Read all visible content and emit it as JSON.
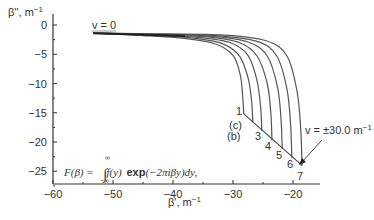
{
  "chart_data": {
    "type": "line",
    "title": "",
    "xlabel": "β', m⁻¹",
    "ylabel": "β'', m⁻¹",
    "xlim": [
      -60,
      -15
    ],
    "ylim": [
      -27,
      2
    ],
    "xticks": [
      -60,
      -50,
      -40,
      -30,
      -20
    ],
    "yticks": [
      0,
      -5,
      -10,
      -15,
      -20,
      -25
    ],
    "xtick_labels": [
      "−60",
      "−50",
      "−40",
      "−30",
      "−20"
    ],
    "ytick_labels": [
      "0",
      "−5",
      "−10",
      "−15",
      "−20",
      "−25"
    ],
    "grid": false,
    "series": [
      {
        "name": "1",
        "x": [
          -53.3,
          -45,
          -38,
          -33,
          -30,
          -28.8,
          -28.4,
          -28.2
        ],
        "y": [
          -1.4,
          -1.8,
          -2.3,
          -3.2,
          -5.2,
          -8.5,
          -12.0,
          -15.2
        ]
      },
      {
        "name": "2",
        "x": [
          -53.3,
          -45,
          -37,
          -32,
          -29,
          -27.5,
          -26.9,
          -26.7
        ],
        "y": [
          -1.4,
          -1.7,
          -2.2,
          -3.1,
          -5.2,
          -9.0,
          -13.0,
          -16.6
        ]
      },
      {
        "name": "3",
        "x": [
          -53.3,
          -45,
          -36,
          -30.5,
          -27.5,
          -26.0,
          -25.4,
          -25.2
        ],
        "y": [
          -1.4,
          -1.7,
          -2.1,
          -3.0,
          -5.2,
          -9.5,
          -14.0,
          -18.1
        ]
      },
      {
        "name": "4",
        "x": [
          -53.3,
          -45,
          -35,
          -29,
          -26,
          -24.3,
          -23.7,
          -23.5
        ],
        "y": [
          -1.4,
          -1.6,
          -2.0,
          -3.0,
          -5.3,
          -10.0,
          -15.0,
          -19.7
        ]
      },
      {
        "name": "5",
        "x": [
          -53.3,
          -45,
          -34,
          -27.5,
          -24.3,
          -22.6,
          -22.0,
          -21.8
        ],
        "y": [
          -1.4,
          -1.6,
          -1.9,
          -2.9,
          -5.3,
          -10.5,
          -16.0,
          -21.2
        ]
      },
      {
        "name": "6",
        "x": [
          -53.3,
          -45,
          -33,
          -26,
          -22.7,
          -21.0,
          -20.4,
          -20.2
        ],
        "y": [
          -1.4,
          -1.5,
          -1.8,
          -2.8,
          -5.3,
          -11.0,
          -17.0,
          -22.7
        ]
      },
      {
        "name": "7",
        "x": [
          -53.3,
          -45,
          -32,
          -24.5,
          -21.0,
          -19.3,
          -18.7,
          -18.5
        ],
        "y": [
          -1.4,
          -1.5,
          -1.7,
          -2.7,
          -5.3,
          -11.5,
          -18.0,
          -24.0
        ]
      }
    ],
    "envelope_line": {
      "x": [
        -28.2,
        -18.5
      ],
      "y": [
        -15.2,
        -24.0
      ]
    },
    "annotations": [
      {
        "text": "v = 0",
        "x": -51.5,
        "y": -0.8
      },
      {
        "text": "1",
        "x": -29.0,
        "y": -14.8
      },
      {
        "text": "(c)",
        "x": -29.5,
        "y": -17.2
      },
      {
        "text": "(b)",
        "x": -29.8,
        "y": -19.0
      },
      {
        "text": "3",
        "x": -26.0,
        "y": -19.0
      },
      {
        "text": "4",
        "x": -24.5,
        "y": -20.8
      },
      {
        "text": "5",
        "x": -22.8,
        "y": -22.4
      },
      {
        "text": "6",
        "x": -21.0,
        "y": -24.0
      },
      {
        "text": "7",
        "x": -19.2,
        "y": -25.8
      },
      {
        "text": "v = ±30.0 m⁻¹",
        "x": -16.5,
        "y": -17.5
      }
    ],
    "formula": "F(β) = ∫₋∞^∞ f(y) exp(−2πiβy)dy,",
    "legend": null
  },
  "labels": {
    "ylabel_text": "β'', m",
    "ylabel_sup": "−1",
    "xlabel_text": "β', m",
    "xlabel_sup": "−1",
    "v_zero": "v = 0",
    "v_thirty": "v = ±30.0 m",
    "v_thirty_sup": "−1",
    "curve_labels": [
      "1",
      "(c)",
      "(b)",
      "3",
      "4",
      "5",
      "6",
      "7"
    ],
    "formula_lhs": "F(β) =",
    "formula_integrand": "f(y)",
    "formula_exp": "exp",
    "formula_arg": "(−2πiβy)dy,",
    "formula_upper": "∞",
    "formula_lower": "−∞"
  }
}
